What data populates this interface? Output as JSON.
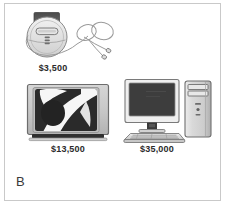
{
  "figure": {
    "panel_letter": "B",
    "background_color": "#ffffff",
    "border_color": "#c9c9c9",
    "text_color": "#2b2b2b"
  },
  "items": [
    {
      "id": "cd-player",
      "icon": "portable-cd-player-with-headphones-icon",
      "name": "Portable CD player",
      "price": "$3,500"
    },
    {
      "id": "television",
      "icon": "television-set-icon",
      "name": "Television set",
      "price": "$13,500"
    },
    {
      "id": "desktop-computer",
      "icon": "desktop-computer-system-icon",
      "name": "Desktop computer system",
      "price": "$35,000"
    }
  ]
}
